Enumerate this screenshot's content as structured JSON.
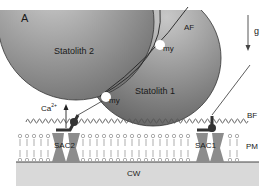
{
  "figure": {
    "panel_label": "A",
    "labels": {
      "statolith_1": "Statolith 1",
      "statolith_2": "Statolith 2",
      "actin_filament": "AF",
      "myosin_top": "my",
      "myosin_bottom": "my",
      "gravity": "g",
      "calcium": "Ca",
      "calcium_charge": "2+",
      "bridge_filament": "BF",
      "channel_1": "SAC1",
      "channel_2": "SAC2",
      "plasma_membrane": "PM",
      "cell_wall": "CW"
    },
    "colors": {
      "statolith_light": "#c4c4c4",
      "statolith_dark": "#6a6a6a",
      "channel": "#8a8a8a",
      "anchor": "#333333",
      "cell_wall": "#d8d8d8",
      "line": "#333333"
    }
  }
}
